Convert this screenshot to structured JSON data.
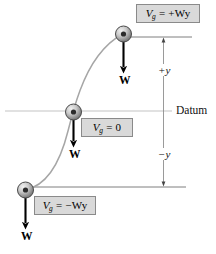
{
  "figure": {
    "datum_label": "Datum",
    "colors": {
      "box_fill": "#d9d9d9",
      "box_border": "#8a8a8a",
      "curve": "#9a9a9a",
      "datum_line": "#b5b5b5",
      "dimension_line": "#8f8f8f",
      "arrow": "#000000",
      "sphere_edge": "#4a4a4a",
      "text": "#000000"
    }
  },
  "positions": {
    "above": {
      "eq_symbol": "V",
      "eq_subscript": "g",
      "eq_rhs": "= +Wy",
      "eq_full": "Vg = +Wy",
      "weight_label": "W"
    },
    "datum": {
      "eq_symbol": "V",
      "eq_subscript": "g",
      "eq_rhs": "= 0",
      "eq_full": "Vg = 0",
      "weight_label": "W"
    },
    "below": {
      "eq_symbol": "V",
      "eq_subscript": "g",
      "eq_rhs": "= −Wy",
      "eq_full": "Vg = −Wy",
      "weight_label": "W"
    }
  },
  "dimensions": {
    "positive": "+y",
    "negative": "−y"
  }
}
